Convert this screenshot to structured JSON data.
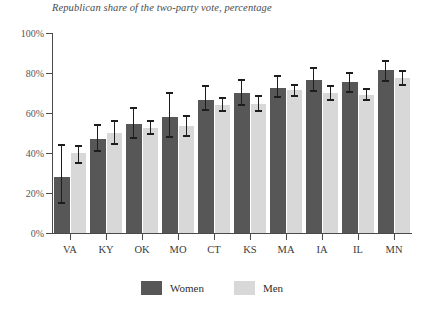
{
  "chart_data": {
    "type": "bar",
    "title": "Republican share of the two-party vote, percentage",
    "xlabel": "",
    "ylabel": "",
    "ylim": [
      0,
      100
    ],
    "ytick_labels": [
      "0%",
      "20%",
      "40%",
      "60%",
      "80%",
      "100%"
    ],
    "ytick_values": [
      0,
      20,
      40,
      60,
      80,
      100
    ],
    "grid": false,
    "legend_position": "bottom-center",
    "categories": [
      "VA",
      "KY",
      "OK",
      "MO",
      "CT",
      "KS",
      "MA",
      "IA",
      "IL",
      "MN"
    ],
    "series": [
      {
        "name": "Women",
        "color": "#575757",
        "values": [
          28,
          47,
          54.5,
          58,
          66.5,
          70,
          72.5,
          76.5,
          75.5,
          81.5
        ],
        "error_low": [
          15,
          41,
          47.5,
          48,
          61.5,
          64,
          68,
          71,
          70.5,
          76
        ],
        "error_high": [
          44,
          54,
          62.5,
          70,
          73.5,
          76.5,
          78.5,
          82.5,
          80,
          86
        ]
      },
      {
        "name": "Men",
        "color": "#d8d8d8",
        "values": [
          40,
          50,
          52.5,
          53.5,
          64,
          64.5,
          71.5,
          70,
          69,
          77.5
        ],
        "error_low": [
          35,
          44.5,
          49.5,
          48.5,
          61,
          61,
          68.5,
          66.5,
          66.5,
          74
        ],
        "error_high": [
          43.5,
          56,
          56,
          58.5,
          67.5,
          68.5,
          74,
          73.5,
          72,
          81
        ]
      }
    ]
  },
  "legend": {
    "items": [
      {
        "label": "Women",
        "color": "#575757"
      },
      {
        "label": "Men",
        "color": "#d8d8d8"
      }
    ]
  }
}
